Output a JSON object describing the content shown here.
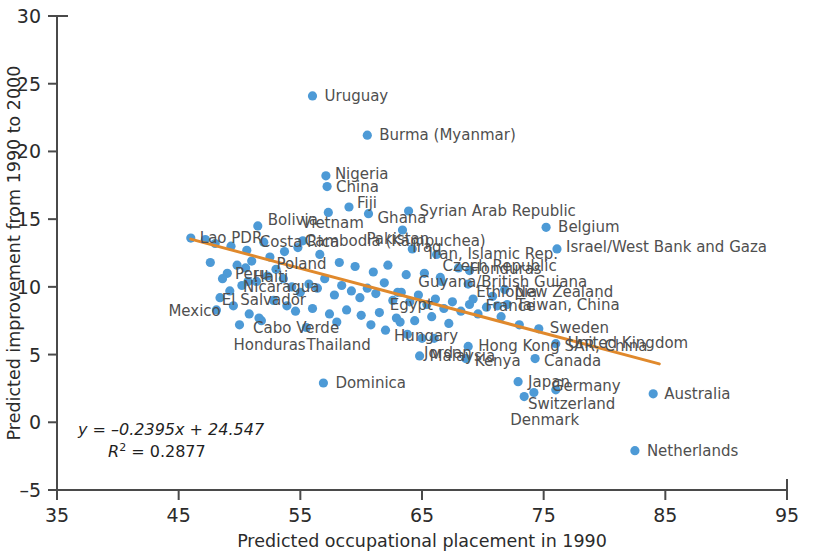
{
  "chart_data": {
    "type": "scatter",
    "title": "",
    "xlabel": "Predicted occupational placement in 1990",
    "ylabel": "Predicted improvement from 1990 to 2000",
    "xlim": [
      35,
      95
    ],
    "ylim": [
      -5,
      30
    ],
    "xticks": [
      35,
      45,
      55,
      65,
      75,
      85,
      95
    ],
    "yticks": [
      -5,
      0,
      5,
      10,
      15,
      20,
      25,
      30
    ],
    "grid": false,
    "legend": null,
    "point_color": "#4d9ad6",
    "trendline_color": "#e0892c",
    "annotations": {
      "equation": "y = –0.2395x + 24.547",
      "r_squared_label": "R",
      "r_squared_exponent": "2",
      "r_squared_value": " = 0.2877"
    },
    "trendline": {
      "slope": -0.2395,
      "intercept": 24.547,
      "x_start": 46.0,
      "x_end": 84.5
    },
    "points": [
      {
        "label": "Uruguay",
        "x": 56.0,
        "y": 24.1,
        "lx": 12,
        "ly": 5
      },
      {
        "label": "Burma (Myanmar)",
        "x": 60.5,
        "y": 21.2,
        "lx": 12,
        "ly": 5
      },
      {
        "label": "Nigeria",
        "x": 57.1,
        "y": 18.2,
        "lx": 9,
        "ly": 3
      },
      {
        "label": "China",
        "x": 57.2,
        "y": 17.4,
        "lx": 9,
        "ly": 5
      },
      {
        "label": "Fiji",
        "x": 59.0,
        "y": 15.9,
        "lx": 8,
        "ly": 1
      },
      {
        "label": "Syrian Arab Republic",
        "x": 63.9,
        "y": 15.6,
        "lx": 11,
        "ly": 5
      },
      {
        "label": "Bolivia",
        "x": 51.5,
        "y": 14.5,
        "lx": 10,
        "ly": -1
      },
      {
        "label": "Ghana",
        "x": 60.6,
        "y": 15.4,
        "lx": 9,
        "ly": 9
      },
      {
        "label": "Vietnam",
        "x": 57.3,
        "y": 15.5,
        "lx": -27,
        "ly": 16
      },
      {
        "label": "Pakistan",
        "x": 63.4,
        "y": 14.2,
        "lx": -36,
        "ly": 14
      },
      {
        "label": "Belgium",
        "x": 75.2,
        "y": 14.4,
        "lx": 12,
        "ly": 5
      },
      {
        "label": "Lao PDR",
        "x": 46.0,
        "y": 13.6,
        "lx": 9,
        "ly": 5
      },
      {
        "label": "Costa Rica",
        "x": 52.0,
        "y": 13.3,
        "lx": -4,
        "ly": 5
      },
      {
        "label": "Cambodia (Kampuchea)",
        "x": 55.2,
        "y": 13.4,
        "lx": 2,
        "ly": 5
      },
      {
        "label": "Israel/West Bank and Gaza",
        "x": 76.1,
        "y": 12.8,
        "lx": 9,
        "ly": 3
      },
      {
        "label": "Poland",
        "x": 53.7,
        "y": 12.6,
        "lx": -8,
        "ly": 17
      },
      {
        "label": "Iraq",
        "x": 64.2,
        "y": 12.8,
        "lx": 0,
        "ly": 3
      },
      {
        "label": "Iran, Islamic Rep.",
        "x": 66.2,
        "y": 12.4,
        "lx": -8,
        "ly": 5
      },
      {
        "label": "Peru",
        "x": 49.8,
        "y": 11.6,
        "lx": -2,
        "ly": 14
      },
      {
        "label": "Haiti",
        "x": 50.5,
        "y": 11.4,
        "lx": 8,
        "ly": 14
      },
      {
        "label": "Czech Republic",
        "x": 68.0,
        "y": 11.4,
        "lx": -16,
        "ly": 3
      },
      {
        "label": "El Salvador",
        "x": 49.2,
        "y": 9.7,
        "lx": -8,
        "ly": 14
      },
      {
        "label": "Nicaragua",
        "x": 50.7,
        "y": 10.4,
        "lx": -5,
        "ly": 11
      },
      {
        "label": "Honduras",
        "x": 68.9,
        "y": 11.2,
        "lx": 0,
        "ly": 3
      },
      {
        "label": "Guyana/British Guiana",
        "x": 66.5,
        "y": 10.7,
        "lx": -22,
        "ly": 10
      },
      {
        "label": "Egypt",
        "x": 63.0,
        "y": 9.6,
        "lx": -8,
        "ly": 18
      },
      {
        "label": "Ethiopia",
        "x": 68.8,
        "y": 10.2,
        "lx": 8,
        "ly": 13
      },
      {
        "label": "New Zealand",
        "x": 71.8,
        "y": 9.8,
        "lx": 10,
        "ly": 7
      },
      {
        "label": "Taiwan, China",
        "x": 72.0,
        "y": 8.7,
        "lx": 9,
        "ly": 5
      },
      {
        "label": "France",
        "x": 71.2,
        "y": 8.6,
        "lx": -12,
        "ly": 5
      },
      {
        "label": "Mexico",
        "x": 48.1,
        "y": 8.3,
        "lx": -48,
        "ly": 6
      },
      {
        "label": "Cabo Verde",
        "x": 51.6,
        "y": 7.7,
        "lx": -6,
        "ly": 15
      },
      {
        "label": "Honduras2",
        "x": 50.0,
        "y": 7.2,
        "lx": -6,
        "ly": 25
      },
      {
        "label": "Thailand",
        "x": 55.5,
        "y": 7.0,
        "lx": 0,
        "ly": 22
      },
      {
        "label": "Hungary",
        "x": 63.2,
        "y": 7.4,
        "lx": -6,
        "ly": 19
      },
      {
        "label": "Sweden",
        "x": 74.6,
        "y": 6.9,
        "lx": 11,
        "ly": 4
      },
      {
        "label": "Jordan",
        "x": 65.0,
        "y": 6.2,
        "lx": 2,
        "ly": 20
      },
      {
        "label": "Hong Kong SAR, China",
        "x": 68.8,
        "y": 5.6,
        "lx": 10,
        "ly": 5
      },
      {
        "label": "United Kingdom",
        "x": 76.0,
        "y": 5.8,
        "lx": 12,
        "ly": 4
      },
      {
        "label": "Malaysia",
        "x": 64.8,
        "y": 4.9,
        "lx": 10,
        "ly": 5
      },
      {
        "label": "Kenya",
        "x": 68.6,
        "y": 4.7,
        "lx": 9,
        "ly": 7
      },
      {
        "label": "Canada",
        "x": 74.3,
        "y": 4.7,
        "lx": 9,
        "ly": 7
      },
      {
        "label": "Japan",
        "x": 72.9,
        "y": 3.0,
        "lx": 10,
        "ly": 5
      },
      {
        "label": "Germany",
        "x": 76.0,
        "y": 2.4,
        "lx": -4,
        "ly": 1
      },
      {
        "label": "Switzerland",
        "x": 74.2,
        "y": 2.2,
        "lx": -6,
        "ly": 16
      },
      {
        "label": "Denmark",
        "x": 73.4,
        "y": 1.9,
        "lx": -14,
        "ly": 28
      },
      {
        "label": "Australia",
        "x": 84.0,
        "y": 2.1,
        "lx": 11,
        "ly": 5
      },
      {
        "label": "Dominica",
        "x": 56.9,
        "y": 2.9,
        "lx": 12,
        "ly": 5
      },
      {
        "label": "Netherlands",
        "x": 82.5,
        "y": -2.1,
        "lx": 12,
        "ly": 5
      }
    ],
    "unlabeled_points": [
      {
        "x": 47.2,
        "y": 13.5
      },
      {
        "x": 48.0,
        "y": 13.2
      },
      {
        "x": 49.3,
        "y": 13.0
      },
      {
        "x": 50.6,
        "y": 12.7
      },
      {
        "x": 51.0,
        "y": 11.9
      },
      {
        "x": 49.0,
        "y": 11.0
      },
      {
        "x": 48.6,
        "y": 10.6
      },
      {
        "x": 50.2,
        "y": 10.1
      },
      {
        "x": 51.4,
        "y": 10.4
      },
      {
        "x": 52.3,
        "y": 10.8
      },
      {
        "x": 53.0,
        "y": 11.3
      },
      {
        "x": 53.6,
        "y": 10.6
      },
      {
        "x": 54.3,
        "y": 10.0
      },
      {
        "x": 55.0,
        "y": 9.6
      },
      {
        "x": 55.7,
        "y": 10.2
      },
      {
        "x": 56.4,
        "y": 9.9
      },
      {
        "x": 57.0,
        "y": 10.6
      },
      {
        "x": 57.8,
        "y": 9.4
      },
      {
        "x": 58.4,
        "y": 10.1
      },
      {
        "x": 59.2,
        "y": 9.7
      },
      {
        "x": 59.9,
        "y": 9.2
      },
      {
        "x": 60.5,
        "y": 9.9
      },
      {
        "x": 61.2,
        "y": 9.5
      },
      {
        "x": 61.9,
        "y": 10.3
      },
      {
        "x": 62.6,
        "y": 9.0
      },
      {
        "x": 63.3,
        "y": 9.6
      },
      {
        "x": 64.0,
        "y": 8.9
      },
      {
        "x": 64.7,
        "y": 9.4
      },
      {
        "x": 65.4,
        "y": 8.7
      },
      {
        "x": 66.1,
        "y": 9.1
      },
      {
        "x": 66.8,
        "y": 8.4
      },
      {
        "x": 67.5,
        "y": 8.9
      },
      {
        "x": 68.2,
        "y": 8.2
      },
      {
        "x": 68.9,
        "y": 8.7
      },
      {
        "x": 69.6,
        "y": 8.0
      },
      {
        "x": 70.3,
        "y": 8.5
      },
      {
        "x": 52.8,
        "y": 9.0
      },
      {
        "x": 53.9,
        "y": 8.6
      },
      {
        "x": 54.6,
        "y": 8.2
      },
      {
        "x": 56.0,
        "y": 8.4
      },
      {
        "x": 57.4,
        "y": 8.0
      },
      {
        "x": 58.8,
        "y": 8.3
      },
      {
        "x": 60.0,
        "y": 7.9
      },
      {
        "x": 61.5,
        "y": 8.1
      },
      {
        "x": 62.9,
        "y": 7.7
      },
      {
        "x": 64.4,
        "y": 7.5
      },
      {
        "x": 65.8,
        "y": 7.8
      },
      {
        "x": 67.2,
        "y": 7.3
      },
      {
        "x": 51.8,
        "y": 7.5
      },
      {
        "x": 50.8,
        "y": 8.0
      },
      {
        "x": 49.5,
        "y": 8.6
      },
      {
        "x": 48.4,
        "y": 9.2
      },
      {
        "x": 47.6,
        "y": 11.8
      },
      {
        "x": 52.5,
        "y": 12.2
      },
      {
        "x": 54.8,
        "y": 12.9
      },
      {
        "x": 56.6,
        "y": 12.4
      },
      {
        "x": 58.2,
        "y": 11.8
      },
      {
        "x": 59.5,
        "y": 11.5
      },
      {
        "x": 61.0,
        "y": 11.1
      },
      {
        "x": 62.2,
        "y": 11.6
      },
      {
        "x": 63.7,
        "y": 10.9
      },
      {
        "x": 65.2,
        "y": 11.0
      },
      {
        "x": 66.6,
        "y": 10.4
      },
      {
        "x": 69.2,
        "y": 9.1
      },
      {
        "x": 70.8,
        "y": 9.3
      },
      {
        "x": 71.5,
        "y": 7.8
      },
      {
        "x": 73.0,
        "y": 7.2
      },
      {
        "x": 62.0,
        "y": 6.8
      },
      {
        "x": 63.8,
        "y": 6.5
      },
      {
        "x": 60.8,
        "y": 7.2
      },
      {
        "x": 58.0,
        "y": 7.4
      },
      {
        "x": 66.0,
        "y": 6.2
      }
    ]
  }
}
